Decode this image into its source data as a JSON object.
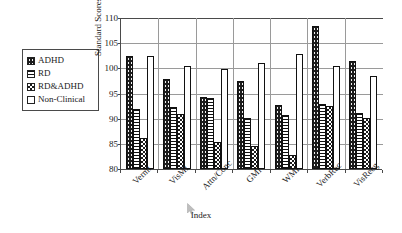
{
  "chart": {
    "ylabel": "Standard Scores",
    "xlabel": "Index"
  },
  "legend": {
    "items": [
      {
        "label": "ADHD",
        "key": "ADHD",
        "swatch": "black-dotted-swatch"
      },
      {
        "label": "RD",
        "key": "RD",
        "swatch": "horizontal-lines-swatch"
      },
      {
        "label": "RD&ADHD",
        "key": "RD&ADHD",
        "swatch": "checkered-swatch"
      },
      {
        "label": "Non-Clinical",
        "key": "Non-Clinical",
        "swatch": "white-swatch"
      }
    ]
  },
  "yticks": [
    "80",
    "85",
    "90",
    "95",
    "100",
    "105",
    "110"
  ],
  "chart_data": {
    "type": "bar",
    "title": "",
    "xlabel": "Index",
    "ylabel": "Standard Scores",
    "ylim": [
      80,
      110
    ],
    "ytick_step": 5,
    "grid": true,
    "legend_position": "left-outside",
    "categories": [
      "Verml",
      "VisMI",
      "Attn/Conc",
      "GMI",
      "WMI",
      "VerbRec",
      "VisRecg"
    ],
    "series": [
      {
        "name": "ADHD",
        "values": [
          102.4,
          97.8,
          94.3,
          97.5,
          92.8,
          108.5,
          101.4
        ]
      },
      {
        "name": "RD",
        "values": [
          91.9,
          92.4,
          94.2,
          90.1,
          90.8,
          93.0,
          91.2
        ]
      },
      {
        "name": "RD&ADHD",
        "values": [
          86.2,
          91.0,
          85.3,
          84.5,
          82.8,
          92.5,
          90.1
        ]
      },
      {
        "name": "Non-Clinical",
        "values": [
          102.4,
          100.4,
          99.8,
          101.0,
          102.9,
          100.4,
          98.5
        ]
      }
    ]
  }
}
